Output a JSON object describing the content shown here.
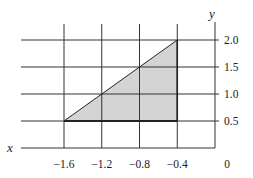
{
  "chart_data": {
    "type": "area",
    "title": "",
    "xlabel": "x",
    "ylabel": "y",
    "x_ticks": [
      -1.6,
      -1.2,
      -0.8,
      -0.4,
      0
    ],
    "x_tick_labels": [
      "−1.6",
      "−1.2",
      "−0.8",
      "−0.4",
      "0"
    ],
    "y_ticks": [
      0.5,
      1.0,
      1.5,
      2.0
    ],
    "y_tick_labels": [
      "0.5",
      "1.0",
      "1.5",
      "2.0"
    ],
    "xlim": [
      -2.0,
      0
    ],
    "ylim": [
      0,
      2.2
    ],
    "grid": true,
    "shaded_region": {
      "shape": "triangle",
      "vertices": [
        [
          -1.6,
          0.5
        ],
        [
          -0.4,
          2.0
        ],
        [
          -0.4,
          0.5
        ]
      ],
      "fill": "#d4d4d4",
      "stroke": "#222222"
    },
    "line_segment": {
      "from": [
        -1.6,
        0.5
      ],
      "to": [
        -0.4,
        2.0
      ]
    },
    "y_axis_position": "right",
    "legend": null
  },
  "colors": {
    "grid": "#333333",
    "fill": "#d4d4d4",
    "text": "#222222"
  }
}
